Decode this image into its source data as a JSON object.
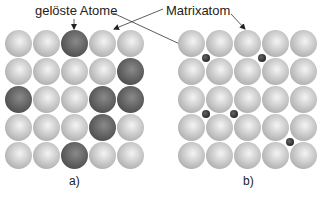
{
  "labels": {
    "solute_atoms": "gelöste Atome",
    "matrix_atom": "Matrixatom"
  },
  "panels": [
    {
      "id": "a",
      "label": "a)",
      "type": "substitutional",
      "rows": 5,
      "cols": 5,
      "grid": [
        [
          "matrix",
          "matrix",
          "solute",
          "matrix",
          "matrix"
        ],
        [
          "matrix",
          "matrix",
          "matrix",
          "matrix",
          "solute"
        ],
        [
          "solute",
          "matrix",
          "matrix",
          "solute",
          "solute"
        ],
        [
          "matrix",
          "matrix",
          "matrix",
          "solute",
          "matrix"
        ],
        [
          "matrix",
          "matrix",
          "solute",
          "matrix",
          "matrix"
        ]
      ]
    },
    {
      "id": "b",
      "label": "b)",
      "type": "interstitial",
      "rows": 5,
      "cols": 5,
      "interstitials": [
        {
          "between_rows": [
            0,
            1
          ],
          "between_cols": [
            0,
            1
          ]
        },
        {
          "between_rows": [
            0,
            1
          ],
          "between_cols": [
            2,
            3
          ]
        },
        {
          "between_rows": [
            2,
            3
          ],
          "between_cols": [
            0,
            1
          ]
        },
        {
          "between_rows": [
            2,
            3
          ],
          "between_cols": [
            1,
            2
          ]
        },
        {
          "between_rows": [
            3,
            4
          ],
          "between_cols": [
            3,
            4
          ]
        }
      ]
    }
  ],
  "colors": {
    "matrix_atom": "#c4c4c4",
    "solute_atom": "#5a5a5a",
    "interstitial_atom": "#2a2a2a",
    "lines": "#333333"
  }
}
